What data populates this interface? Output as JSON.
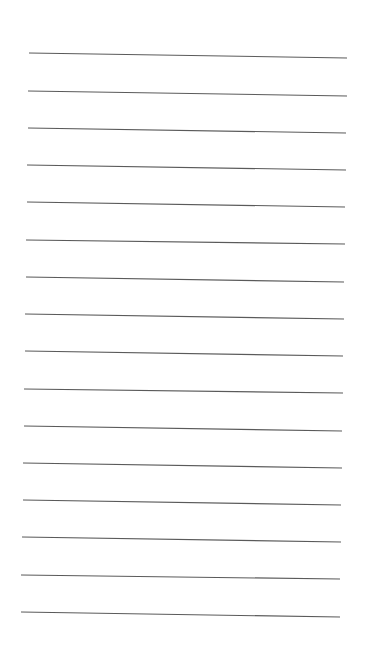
{
  "page": {
    "background": "#ffffff",
    "line_color": "#5a5a5a",
    "line_width": 1.1,
    "line_count": 16
  },
  "lines": [
    {
      "x1": 29,
      "y1": 53,
      "x2": 347,
      "y2": 58
    },
    {
      "x1": 28,
      "y1": 91,
      "x2": 347,
      "y2": 96
    },
    {
      "x1": 28,
      "y1": 128,
      "x2": 346,
      "y2": 133
    },
    {
      "x1": 27,
      "y1": 165,
      "x2": 346,
      "y2": 170
    },
    {
      "x1": 27,
      "y1": 202,
      "x2": 345,
      "y2": 207
    },
    {
      "x1": 26,
      "y1": 240,
      "x2": 345,
      "y2": 244
    },
    {
      "x1": 26,
      "y1": 277,
      "x2": 344,
      "y2": 282
    },
    {
      "x1": 25,
      "y1": 314,
      "x2": 344,
      "y2": 319
    },
    {
      "x1": 25,
      "y1": 351,
      "x2": 343,
      "y2": 356
    },
    {
      "x1": 24,
      "y1": 389,
      "x2": 343,
      "y2": 393
    },
    {
      "x1": 24,
      "y1": 426,
      "x2": 342,
      "y2": 431
    },
    {
      "x1": 23,
      "y1": 463,
      "x2": 342,
      "y2": 468
    },
    {
      "x1": 23,
      "y1": 500,
      "x2": 341,
      "y2": 505
    },
    {
      "x1": 22,
      "y1": 537,
      "x2": 341,
      "y2": 542
    },
    {
      "x1": 21,
      "y1": 575,
      "x2": 340,
      "y2": 579
    },
    {
      "x1": 21,
      "y1": 612,
      "x2": 340,
      "y2": 617
    }
  ]
}
